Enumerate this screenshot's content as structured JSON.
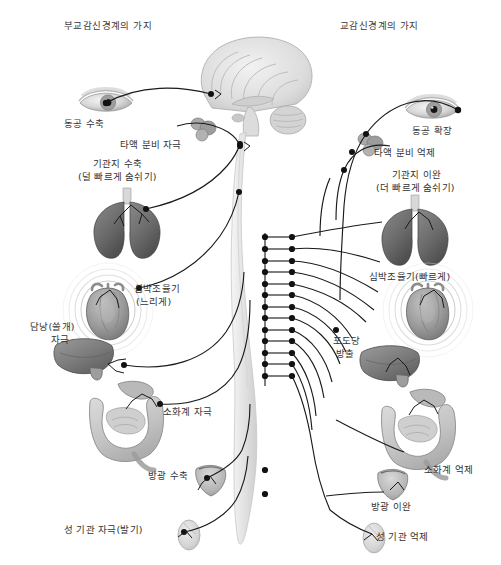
{
  "figure": {
    "type": "anatomical-diagram",
    "palette": {
      "background": "#ffffff",
      "text": "#333333",
      "nerve_line": "#1a1a1a",
      "ganglion": "#111111",
      "brain_fill": "#dedede",
      "spinal_cord_fill": "#e9e9e9",
      "lung_fill": "#6d6d6d",
      "heart_fill": "#9a9a9a",
      "liver_fill": "#7c7c7c",
      "intestine_fill": "#c9c9c9",
      "bladder_fill": "#b9b9b9",
      "gonad_fill": "#d5d5d5",
      "salivary_fill": "#a8a8a8"
    }
  },
  "headings": {
    "left": "부교감신경계의 가지",
    "right": "교감신경계의 가지"
  },
  "parasympathetic": {
    "side": "left",
    "labels": [
      {
        "id": "pupil-constriction",
        "text": "동공 수축",
        "x": 64,
        "y": 118,
        "align": "left"
      },
      {
        "id": "salivation-stim",
        "text": "타액 분비 자극",
        "x": 120,
        "y": 139,
        "align": "left"
      },
      {
        "id": "bronchi-constrict",
        "text": "기관지 수축",
        "x": 93,
        "y": 158,
        "align": "left"
      },
      {
        "id": "bronchi-constrict-2",
        "text": "(덜 빠르게 숨쉬기)",
        "x": 78,
        "y": 171,
        "align": "left"
      },
      {
        "id": "pacemaker-slow",
        "text": "심박조율기",
        "x": 134,
        "y": 283,
        "align": "left"
      },
      {
        "id": "pacemaker-slow-2",
        "text": "(느리게)",
        "x": 136,
        "y": 296,
        "align": "left"
      },
      {
        "id": "gallbladder-stim",
        "text": "담낭(쓸개)",
        "x": 30,
        "y": 321,
        "align": "left"
      },
      {
        "id": "gallbladder-stim-2",
        "text": "자극",
        "x": 51,
        "y": 334,
        "align": "left"
      },
      {
        "id": "digestion-stim",
        "text": "소화계 자극",
        "x": 163,
        "y": 406,
        "align": "left"
      },
      {
        "id": "bladder-contract",
        "text": "방광 수축",
        "x": 148,
        "y": 470,
        "align": "left"
      },
      {
        "id": "sex-organ-stim",
        "text": "성 기관 자극(발기)",
        "x": 64,
        "y": 524,
        "align": "left"
      }
    ]
  },
  "sympathetic": {
    "side": "right",
    "labels": [
      {
        "id": "pupil-dilation",
        "text": "동공 확장",
        "x": 412,
        "y": 125,
        "align": "left"
      },
      {
        "id": "salivation-inhib",
        "text": "타액 분비 억제",
        "x": 374,
        "y": 147,
        "align": "left"
      },
      {
        "id": "bronchi-relax",
        "text": "기관지 이완",
        "x": 392,
        "y": 169,
        "align": "left"
      },
      {
        "id": "bronchi-relax-2",
        "text": "(더 빠르게 숨쉬기)",
        "x": 376,
        "y": 182,
        "align": "left"
      },
      {
        "id": "pacemaker-fast",
        "text": "심박조율기(빠르게)",
        "x": 369,
        "y": 271,
        "align": "left"
      },
      {
        "id": "glucose-release",
        "text": "포도당",
        "x": 333,
        "y": 335,
        "align": "left"
      },
      {
        "id": "glucose-release-2",
        "text": "방출",
        "x": 336,
        "y": 348,
        "align": "left"
      },
      {
        "id": "digestion-inhib",
        "text": "소화계 억제",
        "x": 424,
        "y": 464,
        "align": "left"
      },
      {
        "id": "bladder-relax",
        "text": "방광 이완",
        "x": 371,
        "y": 501,
        "align": "left"
      },
      {
        "id": "sex-organ-inhib",
        "text": "성 기관 억제",
        "x": 376,
        "y": 531,
        "align": "left"
      }
    ]
  },
  "organs": [
    {
      "id": "brain",
      "name": "brain-sagittal",
      "side": "center"
    },
    {
      "id": "spinal-cord",
      "name": "spinal-cord",
      "side": "center"
    },
    {
      "id": "eye-left",
      "name": "eye",
      "side": "left"
    },
    {
      "id": "eye-right",
      "name": "eye",
      "side": "right"
    },
    {
      "id": "salivary-left",
      "name": "salivary-gland",
      "side": "left"
    },
    {
      "id": "salivary-right",
      "name": "salivary-gland",
      "side": "right"
    },
    {
      "id": "lungs-left",
      "name": "lungs",
      "side": "left"
    },
    {
      "id": "lungs-right",
      "name": "lungs",
      "side": "right"
    },
    {
      "id": "heart-left",
      "name": "heart",
      "side": "left"
    },
    {
      "id": "heart-right",
      "name": "heart",
      "side": "right"
    },
    {
      "id": "liver-left",
      "name": "liver-gallbladder",
      "side": "left"
    },
    {
      "id": "liver-right",
      "name": "liver",
      "side": "right"
    },
    {
      "id": "intestines-left",
      "name": "stomach-intestines",
      "side": "left"
    },
    {
      "id": "intestines-right",
      "name": "stomach-intestines",
      "side": "right"
    },
    {
      "id": "bladder-left",
      "name": "bladder",
      "side": "left"
    },
    {
      "id": "bladder-right",
      "name": "bladder",
      "side": "right"
    },
    {
      "id": "gonad-left",
      "name": "reproductive-organ",
      "side": "left"
    },
    {
      "id": "gonad-right",
      "name": "reproductive-organ",
      "side": "right"
    }
  ],
  "sympathetic_chain": {
    "ganglion_count": 13,
    "description": "paired sympathetic chain ganglia along spinal cord"
  }
}
